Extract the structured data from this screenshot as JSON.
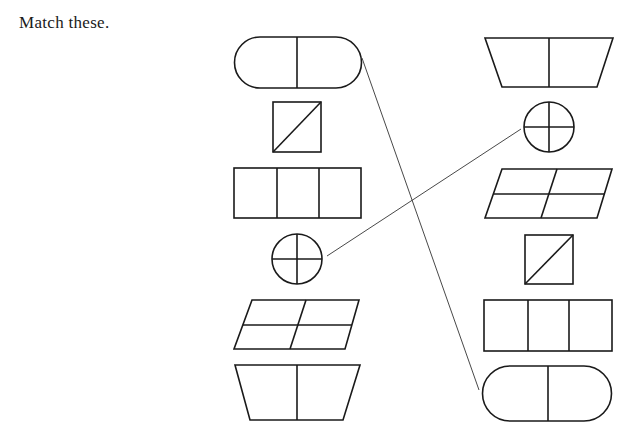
{
  "instruction": "Match these.",
  "left_column": [
    {
      "shape": "pill-split-2"
    },
    {
      "shape": "square-diagonal"
    },
    {
      "shape": "rectangle-split-3"
    },
    {
      "shape": "circle-cross"
    },
    {
      "shape": "parallelogram-split-4"
    },
    {
      "shape": "trapezoid-split-2"
    }
  ],
  "right_column": [
    {
      "shape": "trapezoid-split-2"
    },
    {
      "shape": "circle-cross"
    },
    {
      "shape": "parallelogram-split-4"
    },
    {
      "shape": "square-diagonal"
    },
    {
      "shape": "rectangle-split-3"
    },
    {
      "shape": "pill-split-2"
    }
  ],
  "matches_drawn": [
    {
      "from": "left-pill-split-2",
      "to": "right-pill-split-2"
    },
    {
      "from": "left-circle-cross",
      "to": "right-circle-cross"
    }
  ],
  "colors": {
    "ink": "#1a1a1a",
    "background": "#ffffff"
  }
}
